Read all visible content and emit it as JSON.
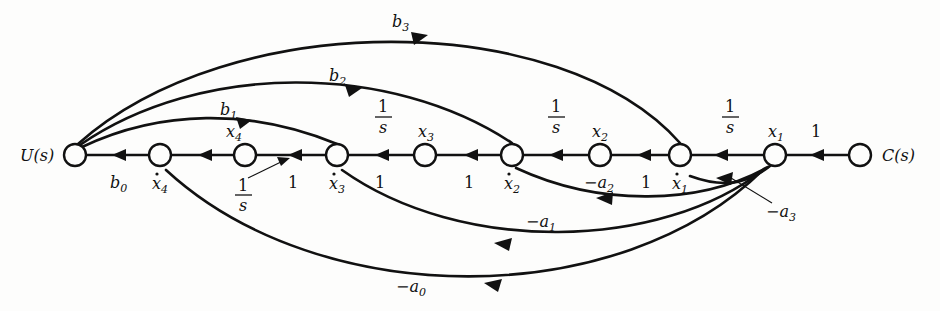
{
  "figure": {
    "type": "signal-flow-graph",
    "title": "",
    "input_label": "U(s)",
    "output_label": "C(s)"
  },
  "nodes": [
    {
      "id": "u",
      "x": 75,
      "y": 155,
      "r": 11,
      "label_left": "U(s)"
    },
    {
      "id": "x4d",
      "x": 160,
      "y": 155,
      "r": 11,
      "label_below": "x̄4"
    },
    {
      "id": "x4",
      "x": 245,
      "y": 155,
      "r": 11,
      "label_above": "x4"
    },
    {
      "id": "x3d",
      "x": 337,
      "y": 155,
      "r": 11,
      "label_below": "x̄3"
    },
    {
      "id": "x3",
      "x": 425,
      "y": 155,
      "r": 11,
      "label_above": "x3"
    },
    {
      "id": "x2d",
      "x": 512,
      "y": 155,
      "r": 11,
      "label_below": "x̄2"
    },
    {
      "id": "x2",
      "x": 600,
      "y": 155,
      "r": 11,
      "label_above": "x2"
    },
    {
      "id": "x1d",
      "x": 680,
      "y": 155,
      "r": 11,
      "label_below": "x̄1"
    },
    {
      "id": "x1",
      "x": 775,
      "y": 155,
      "r": 11,
      "label_above": "x1"
    },
    {
      "id": "c",
      "x": 860,
      "y": 155,
      "r": 11,
      "label_right": "C(s)"
    }
  ],
  "node_labels": {
    "u_left": "U(s)",
    "c_right": "C(s)",
    "x4_above": {
      "base": "x",
      "sub": "4"
    },
    "x3_above": {
      "base": "x",
      "sub": "3"
    },
    "x2_above": {
      "base": "x",
      "sub": "2"
    },
    "x1_above": {
      "base": "x",
      "sub": "1"
    },
    "x4dot_below": {
      "base": "x",
      "sub": "4",
      "dot": true
    },
    "x3dot_below": {
      "base": "x",
      "sub": "3",
      "dot": true
    },
    "x2dot_below": {
      "base": "x",
      "sub": "2",
      "dot": true
    },
    "x1dot_below": {
      "base": "x",
      "sub": "1",
      "dot": true
    }
  },
  "edge_labels": {
    "b0": {
      "base": "b",
      "sub": "0",
      "x": 118,
      "y": 183
    },
    "b1": {
      "base": "b",
      "sub": "1",
      "x": 228,
      "y": 110
    },
    "b2": {
      "base": "b",
      "sub": "2",
      "x": 337,
      "y": 76
    },
    "b3": {
      "base": "b",
      "sub": "3",
      "x": 400,
      "y": 22
    },
    "a0": {
      "base": "a",
      "sub": "0",
      "neg": true,
      "x": 410,
      "y": 287
    },
    "a1": {
      "base": "a",
      "sub": "1",
      "neg": true,
      "x": 540,
      "y": 222
    },
    "a2": {
      "base": "a",
      "sub": "2",
      "neg": true,
      "x": 598,
      "y": 183
    },
    "a3": {
      "base": "a",
      "sub": "3",
      "neg": true,
      "x": 780,
      "y": 212
    },
    "one_a": {
      "text": "1",
      "x": 292,
      "y": 183
    },
    "one_b": {
      "text": "1",
      "x": 379,
      "y": 183
    },
    "one_c": {
      "text": "1",
      "x": 468,
      "y": 183
    },
    "one_d": {
      "text": "1",
      "x": 645,
      "y": 183
    },
    "one_e": {
      "text": "1",
      "x": 815,
      "y": 132
    }
  },
  "fractions": [
    {
      "num": "1",
      "den": "s",
      "x": 248,
      "y": 188,
      "leader": true
    },
    {
      "num": "1",
      "den": "s",
      "x": 383,
      "y": 110,
      "leader": false
    },
    {
      "num": "1",
      "den": "s",
      "x": 556,
      "y": 110,
      "leader": false
    },
    {
      "num": "1",
      "den": "s",
      "x": 730,
      "y": 110,
      "leader": false
    }
  ],
  "edges": [
    {
      "from": "u",
      "to": "x4d",
      "gain": "b0",
      "kind": "straight"
    },
    {
      "from": "x4d",
      "to": "x4",
      "gain": "1/s",
      "kind": "straight"
    },
    {
      "from": "x4",
      "to": "x3d",
      "gain": "1",
      "kind": "straight"
    },
    {
      "from": "x3d",
      "to": "x3",
      "gain": "1/s",
      "kind": "straight"
    },
    {
      "from": "x3",
      "to": "x2d",
      "gain": "1",
      "kind": "straight"
    },
    {
      "from": "x2d",
      "to": "x2",
      "gain": "1/s",
      "kind": "straight"
    },
    {
      "from": "x2",
      "to": "x1d",
      "gain": "1",
      "kind": "straight"
    },
    {
      "from": "x1d",
      "to": "x1",
      "gain": "1/s",
      "kind": "straight"
    },
    {
      "from": "x1",
      "to": "c",
      "gain": "1",
      "kind": "straight"
    },
    {
      "from": "u",
      "to": "x3d",
      "gain": "b1",
      "kind": "arc-above"
    },
    {
      "from": "u",
      "to": "x2d",
      "gain": "b2",
      "kind": "arc-above"
    },
    {
      "from": "u",
      "to": "x1d",
      "gain": "b3",
      "kind": "arc-above"
    },
    {
      "from": "x1",
      "to": "x1d",
      "gain": "-a3",
      "kind": "arc-below-feedback"
    },
    {
      "from": "x1",
      "to": "x2d",
      "gain": "-a2",
      "kind": "arc-below-feedback"
    },
    {
      "from": "x1",
      "to": "x3d",
      "gain": "-a1",
      "kind": "arc-below-feedback"
    },
    {
      "from": "x1",
      "to": "x4d",
      "gain": "-a0",
      "kind": "arc-below-feedback"
    }
  ],
  "colors": {
    "ink": "#111111",
    "background": "#fdfdfc"
  }
}
